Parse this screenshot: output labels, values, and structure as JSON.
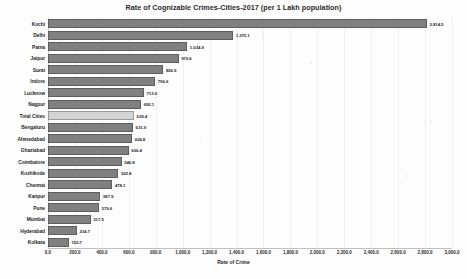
{
  "chart_data": {
    "type": "bar",
    "orientation": "horizontal",
    "title": "Rate of Cognizable Crimes-Cities-2017 (per 1 Lakh population)",
    "xlabel": "Rate of Crime",
    "ylabel": "",
    "xlim": [
      0,
      3000
    ],
    "grid": true,
    "legend": "none",
    "highlight_category": "Total Cities",
    "categories": [
      "Kochi",
      "Delhi",
      "Patna",
      "Jaipur",
      "Surat",
      "Indore",
      "Lucknow",
      "Nagpur",
      "Total Cities",
      "Bengaluru",
      "Ahmedabad",
      "Ghaziabad",
      "Coimbatore",
      "Kozhikode",
      "Chennai",
      "Kanpur",
      "Pune",
      "Mumbai",
      "Hyderabad",
      "Kolkata"
    ],
    "values": [
      2814.5,
      1375.1,
      1034.9,
      970.6,
      856.9,
      796.6,
      713.0,
      692.1,
      639.4,
      631.9,
      624.8,
      600.4,
      546.8,
      522.8,
      478.1,
      387.9,
      379.6,
      317.5,
      214.7,
      155.7
    ],
    "value_labels": [
      "2,814.5",
      "1,375.1",
      "1,034.9",
      "970.6",
      "856.9",
      "796.6",
      "713.0",
      "692.1",
      "639.4",
      "631.9",
      "624.8",
      "600.4",
      "546.8",
      "522.8",
      "478.1",
      "387.9",
      "379.6",
      "317.5",
      "214.7",
      "155.7"
    ],
    "xticks": [
      0,
      200,
      400,
      600,
      800,
      1000,
      1200,
      1400,
      1600,
      1800,
      2000,
      2200,
      2400,
      2600,
      2800,
      3000
    ],
    "xtick_labels": [
      "0.0",
      "200.0",
      "400.0",
      "600.0",
      "800.0",
      "1,000.0",
      "1,200.0",
      "1,400.0",
      "1,600.0",
      "1,800.0",
      "2,000.0",
      "2,200.0",
      "2,400.0",
      "2,600.0",
      "2,800.0",
      "3,000.0"
    ],
    "colors": {
      "bar": "#808080",
      "bar_border": "#5d5d5d",
      "highlight_bar": "#d4d4d4",
      "highlight_border": "#9a9a9a",
      "gridline": "#efefef",
      "text": "#2a2a2a",
      "background": "#fdfdfd"
    }
  }
}
